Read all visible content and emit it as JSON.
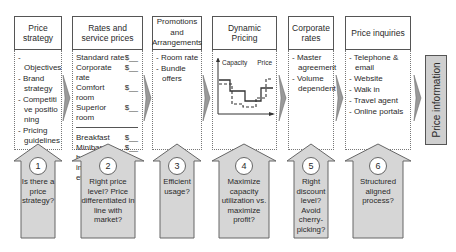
{
  "columns": [
    {
      "title": "Price strategy",
      "items": [
        "Objectives",
        "Brand strategy",
        "Competitive positioning",
        "Pricing guidelines"
      ]
    },
    {
      "title": "Rates and service prices",
      "rates": [
        {
          "label": "Standard rate",
          "value": "$__"
        },
        {
          "label": "Corporate rate",
          "value": "$__"
        },
        {
          "label": "Comfort room",
          "value": "$__"
        },
        {
          "label": "Superior room",
          "value": "$__"
        }
      ],
      "services": [
        {
          "label": "Breakfast",
          "value": "$__"
        },
        {
          "label": "Minibar",
          "value": "$__"
        }
      ],
      "services_note": "beverages, internet access etc."
    },
    {
      "title": "Promotions and Arrangements",
      "items": [
        "Room rate",
        "Bundle offers"
      ]
    },
    {
      "title": "Dynamic Pricing",
      "chart_labels": {
        "left": "Capacity",
        "right": "Price"
      }
    },
    {
      "title": "Corporate rates",
      "items": [
        "Master agreement",
        "Volume dependent"
      ]
    },
    {
      "title": "Price inquiries",
      "items": [
        "Telephone & email",
        "Website",
        "Walk in",
        "Travel agent",
        "Online portals"
      ]
    }
  ],
  "questions": [
    {
      "number": "1",
      "text": "Is there a price strategy?"
    },
    {
      "number": "2",
      "text": "Right price level? Price differentiated in line with market?"
    },
    {
      "number": "3",
      "text": "Efficient usage?"
    },
    {
      "number": "4",
      "text": "Maximize capacity utilization vs. maximize profit?"
    },
    {
      "number": "5",
      "text": "Right discount level? Avoid cherry-picking?"
    },
    {
      "number": "6",
      "text": "Structured aligned process?"
    }
  ],
  "side_label": "Price information",
  "colors": {
    "arrow_fill": "#d6d6d6",
    "border": "#555555",
    "side_fill": "#cfcfcf"
  }
}
